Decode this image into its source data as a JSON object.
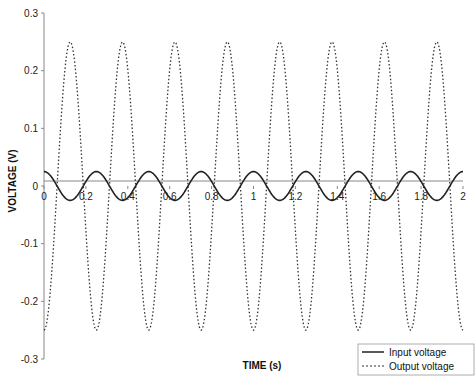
{
  "chart_data": {
    "type": "line",
    "title": "",
    "xlabel": "TIME (s)",
    "ylabel": "VOLTAGE (V)",
    "xlim": [
      0,
      2
    ],
    "ylim": [
      -0.3,
      0.3
    ],
    "x_ticks": [
      0,
      0.2,
      0.4,
      0.6,
      0.8,
      1,
      1.2,
      1.4,
      1.6,
      1.8,
      2
    ],
    "x_tick_labels": [
      "0",
      "0.2",
      "0.4",
      "0.6",
      "0.8",
      "1",
      "1.2",
      "1.4",
      "1.6",
      "1.8",
      "2"
    ],
    "y_ticks": [
      0.3,
      0.2,
      0.1,
      0,
      -0.1,
      -0.2,
      -0.3
    ],
    "y_tick_labels": [
      "0.3",
      "0.2",
      "0.1",
      "0",
      "-0.1",
      "-0.2",
      "-0.3"
    ],
    "grid": false,
    "legend_position": "lower right",
    "series": [
      {
        "name": "Input voltage",
        "style": "solid",
        "color": "#222222",
        "function": "0.025*cos(2*pi*4*t)",
        "amplitude": 0.025,
        "frequency_hz": 4,
        "phase": "cos",
        "x": [
          0,
          0.0625,
          0.125,
          0.1875,
          0.25,
          0.3125,
          0.375,
          0.4375,
          0.5,
          0.5625,
          0.625,
          0.6875,
          0.75,
          0.8125,
          0.875,
          0.9375,
          1.0,
          1.0625,
          1.125,
          1.1875,
          1.25,
          1.3125,
          1.375,
          1.4375,
          1.5,
          1.5625,
          1.625,
          1.6875,
          1.75,
          1.8125,
          1.875,
          1.9375,
          2.0
        ],
        "values": [
          0.025,
          0,
          -0.025,
          0,
          0.025,
          0,
          -0.025,
          0,
          0.025,
          0,
          -0.025,
          0,
          0.025,
          0,
          -0.025,
          0,
          0.025,
          0,
          -0.025,
          0,
          0.025,
          0,
          -0.025,
          0,
          0.025,
          0,
          -0.025,
          0,
          0.025,
          0,
          -0.025,
          0,
          0.025
        ]
      },
      {
        "name": "Output voltage",
        "style": "dotted",
        "color": "#333333",
        "function": "-0.25*cos(2*pi*4*t)",
        "amplitude": 0.25,
        "frequency_hz": 4,
        "phase": "-cos",
        "x": [
          0,
          0.0625,
          0.125,
          0.1875,
          0.25,
          0.3125,
          0.375,
          0.4375,
          0.5,
          0.5625,
          0.625,
          0.6875,
          0.75,
          0.8125,
          0.875,
          0.9375,
          1.0,
          1.0625,
          1.125,
          1.1875,
          1.25,
          1.3125,
          1.375,
          1.4375,
          1.5,
          1.5625,
          1.625,
          1.6875,
          1.75,
          1.8125,
          1.875,
          1.9375,
          2.0
        ],
        "values": [
          -0.25,
          0,
          0.25,
          0,
          -0.25,
          0,
          0.25,
          0,
          -0.25,
          0,
          0.25,
          0,
          -0.25,
          0,
          0.25,
          0,
          -0.25,
          0,
          0.25,
          0,
          -0.25,
          0,
          0.25,
          0,
          -0.25,
          0,
          0.25,
          0,
          -0.25,
          0,
          0.25,
          0,
          -0.25
        ]
      }
    ]
  },
  "legend": {
    "items": [
      {
        "label": "Input voltage",
        "style": "solid"
      },
      {
        "label": "Output voltage",
        "style": "dotted"
      }
    ]
  },
  "colors": {
    "axis": "#888888",
    "input_line": "#222222",
    "output_line": "#333333",
    "background": "#ffffff"
  }
}
